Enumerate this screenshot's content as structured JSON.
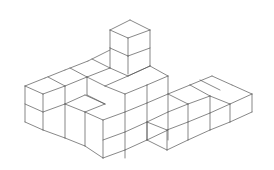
{
  "diagram": {
    "type": "isometric-cube-structure",
    "stroke_color": "#555555",
    "background": "#ffffff",
    "segments": [
      [
        110,
        30,
        130,
        20
      ],
      [
        130,
        20,
        150,
        30
      ],
      [
        150,
        30,
        128,
        38
      ],
      [
        128,
        38,
        110,
        30
      ],
      [
        110,
        30,
        110,
        48
      ],
      [
        128,
        38,
        128,
        56
      ],
      [
        150,
        30,
        150,
        66
      ],
      [
        110,
        48,
        128,
        56
      ],
      [
        128,
        56,
        150,
        48
      ],
      [
        110,
        48,
        110,
        68
      ],
      [
        128,
        56,
        128,
        74
      ],
      [
        25,
        86,
        45,
        78
      ],
      [
        45,
        78,
        65,
        70
      ],
      [
        65,
        70,
        88,
        61
      ],
      [
        88,
        61,
        110,
        50
      ],
      [
        25,
        86,
        43,
        94
      ],
      [
        43,
        94,
        65,
        86
      ],
      [
        65,
        86,
        87,
        77
      ],
      [
        87,
        77,
        110,
        68
      ],
      [
        48,
        77,
        65,
        86
      ],
      [
        70,
        68,
        87,
        77
      ],
      [
        92,
        59,
        110,
        68
      ],
      [
        110,
        68,
        128,
        76
      ],
      [
        128,
        76,
        150,
        66
      ],
      [
        150,
        66,
        168,
        76
      ],
      [
        128,
        76,
        105,
        86
      ],
      [
        105,
        86,
        87,
        77
      ],
      [
        150,
        66,
        128,
        76
      ],
      [
        168,
        76,
        147,
        85
      ],
      [
        147,
        85,
        125,
        94
      ],
      [
        105,
        86,
        125,
        94
      ],
      [
        25,
        86,
        25,
        122
      ],
      [
        43,
        94,
        43,
        130
      ],
      [
        65,
        86,
        65,
        104
      ],
      [
        87,
        77,
        87,
        95
      ],
      [
        125,
        94,
        125,
        158
      ],
      [
        168,
        76,
        168,
        140
      ],
      [
        25,
        104,
        43,
        112
      ],
      [
        43,
        112,
        65,
        104
      ],
      [
        25,
        122,
        43,
        130
      ],
      [
        43,
        130,
        65,
        138
      ],
      [
        65,
        138,
        85,
        146
      ],
      [
        85,
        146,
        103,
        158
      ],
      [
        65,
        104,
        85,
        112
      ],
      [
        85,
        112,
        105,
        104
      ],
      [
        87,
        95,
        105,
        104
      ],
      [
        65,
        104,
        65,
        138
      ],
      [
        85,
        112,
        85,
        146
      ],
      [
        103,
        120,
        103,
        158
      ],
      [
        85,
        112,
        103,
        120
      ],
      [
        103,
        120,
        125,
        112
      ],
      [
        125,
        112,
        147,
        103
      ],
      [
        147,
        103,
        168,
        94
      ],
      [
        103,
        140,
        125,
        132
      ],
      [
        125,
        132,
        147,
        122
      ],
      [
        147,
        122,
        168,
        112
      ],
      [
        103,
        158,
        125,
        150
      ],
      [
        125,
        150,
        147,
        140
      ],
      [
        147,
        140,
        168,
        130
      ],
      [
        147,
        85,
        147,
        140
      ],
      [
        65,
        104,
        85,
        95
      ],
      [
        85,
        95,
        105,
        104
      ],
      [
        168,
        94,
        190,
        85
      ],
      [
        190,
        85,
        212,
        76
      ],
      [
        212,
        76,
        232,
        85
      ],
      [
        232,
        85,
        252,
        94
      ],
      [
        168,
        94,
        188,
        104
      ],
      [
        188,
        104,
        210,
        96
      ],
      [
        210,
        96,
        230,
        104
      ],
      [
        230,
        104,
        252,
        94
      ],
      [
        190,
        85,
        210,
        96
      ],
      [
        200,
        80,
        220,
        90
      ],
      [
        147,
        122,
        167,
        130
      ],
      [
        167,
        130,
        188,
        122
      ],
      [
        188,
        122,
        210,
        113
      ],
      [
        210,
        113,
        230,
        104
      ],
      [
        147,
        122,
        147,
        140
      ],
      [
        167,
        130,
        167,
        150
      ],
      [
        188,
        104,
        188,
        140
      ],
      [
        210,
        96,
        210,
        130
      ],
      [
        230,
        104,
        230,
        122
      ],
      [
        252,
        94,
        252,
        112
      ],
      [
        167,
        150,
        188,
        140
      ],
      [
        188,
        140,
        210,
        130
      ],
      [
        210,
        130,
        230,
        122
      ],
      [
        230,
        122,
        252,
        112
      ],
      [
        147,
        140,
        167,
        150
      ],
      [
        168,
        112,
        188,
        104
      ]
    ]
  }
}
